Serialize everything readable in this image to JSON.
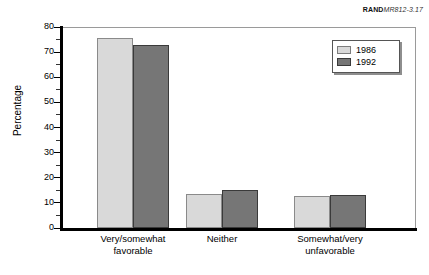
{
  "figure_id": {
    "prefix": "RAND",
    "number": "MR812-3.17"
  },
  "legend": {
    "position": "top-right-inside",
    "entries": [
      {
        "label": "1986",
        "color": "#d9d9d9",
        "swatch_name": "legend-swatch-1986"
      },
      {
        "label": "1992",
        "color": "#767676",
        "swatch_name": "legend-swatch-1992"
      }
    ]
  },
  "axes": {
    "y_title": "Percentage",
    "y_ticks": [
      "0",
      "10",
      "20",
      "30",
      "40",
      "50",
      "60",
      "70",
      "80"
    ],
    "y_minor_step": 5
  },
  "chart_data": {
    "type": "bar",
    "title": "",
    "subtitle": "",
    "xlabel": "",
    "ylabel": "Percentage",
    "ylim": [
      0,
      80
    ],
    "ytick_step": 10,
    "yminor_step": 5,
    "grid": false,
    "legend_position": "upper right",
    "categories": [
      "Very/somewhat favorable",
      "Neither",
      "Somewhat/very unfavorable"
    ],
    "category_lines": [
      [
        "Very/somewhat",
        "favorable"
      ],
      [
        "Neither",
        ""
      ],
      [
        "Somewhat/very",
        "unfavorable"
      ]
    ],
    "series": [
      {
        "name": "1986",
        "color": "#d9d9d9",
        "values": [
          75.5,
          13.5,
          12.8
        ]
      },
      {
        "name": "1992",
        "color": "#767676",
        "values": [
          73.0,
          15.2,
          13.2
        ]
      }
    ],
    "annotations": [
      "RANDMR812-3.17"
    ]
  }
}
